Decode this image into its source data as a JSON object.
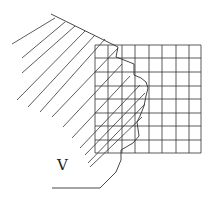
{
  "diagram": {
    "label": "V",
    "grid": {
      "x0": 95,
      "y0": 45,
      "x1": 201,
      "y1": 153,
      "cols": 8,
      "rows": 8
    },
    "stroke_color": "#333333"
  }
}
